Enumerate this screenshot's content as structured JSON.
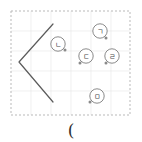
{
  "figure": {
    "background_color": "#ffffff",
    "frame": {
      "name": "dashed-frame",
      "x": 11,
      "y": 11,
      "width": 119,
      "height": 104,
      "stroke_color": "#b9b9b9",
      "dash": "2 2",
      "stroke_width": 1
    },
    "grid": {
      "visible": true,
      "color": "#e6e6e6",
      "x_lines": [
        31,
        51,
        71,
        91,
        111
      ],
      "y_lines": [
        31,
        51,
        71,
        91
      ],
      "stroke_width": 0.6
    },
    "angle_shape": {
      "name": "angle-bracket-shape",
      "glyph": "<",
      "stroke_color": "#5b5b5b",
      "stroke_width": 1.2,
      "points": [
        {
          "x": 53,
          "y": 24
        },
        {
          "x": 19,
          "y": 62
        },
        {
          "x": 53,
          "y": 102
        }
      ]
    },
    "markers": [
      {
        "name": "point-giyeok",
        "label": "ㄱ",
        "circle": {
          "cx": 100,
          "cy": 31,
          "r": 7.2
        },
        "dot": {
          "cx": 106,
          "cy": 38,
          "r": 1.5
        },
        "stroke_color": "#7d7d7d",
        "dot_color": "#8a8a8a"
      },
      {
        "name": "point-nieun",
        "label": "ㄴ",
        "circle": {
          "cx": 58,
          "cy": 44,
          "r": 7.2
        },
        "dot": {
          "cx": 65,
          "cy": 50,
          "r": 1.5
        },
        "stroke_color": "#7d7d7d",
        "dot_color": "#8a8a8a"
      },
      {
        "name": "point-digeut",
        "label": "ㄷ",
        "circle": {
          "cx": 86,
          "cy": 56,
          "r": 7.2
        },
        "dot": {
          "cx": 80,
          "cy": 63,
          "r": 1.5
        },
        "stroke_color": "#7d7d7d",
        "dot_color": "#8a8a8a"
      },
      {
        "name": "point-rieul",
        "label": "ㄹ",
        "circle": {
          "cx": 112,
          "cy": 56,
          "r": 7.2
        },
        "dot": {
          "cx": 106,
          "cy": 63,
          "r": 1.5
        },
        "stroke_color": "#7d7d7d",
        "dot_color": "#8a8a8a"
      },
      {
        "name": "point-mieum",
        "label": "ㅁ",
        "circle": {
          "cx": 97,
          "cy": 96,
          "r": 7.2
        },
        "dot": {
          "cx": 90,
          "cy": 102,
          "r": 1.5
        },
        "stroke_color": "#7d7d7d",
        "dot_color": "#8a8a8a"
      }
    ],
    "caption": {
      "name": "paren-mark",
      "text": "(",
      "x": 71,
      "y": 130,
      "color": "#2f2f2f"
    }
  }
}
